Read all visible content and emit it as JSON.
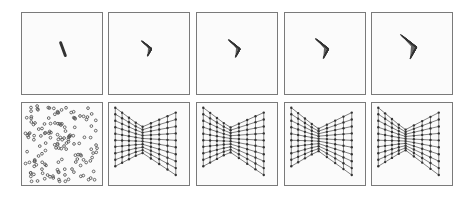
{
  "figure": {
    "background": "#ffffff",
    "panel_border": "#7a7a7a",
    "ink": "#333333",
    "rows": [
      {
        "name": "collapsed-grid-row",
        "panels": [
          {
            "x": 21,
            "y": 12,
            "w": 82,
            "h": 83,
            "kind": "line",
            "cx": 42,
            "cy": 37,
            "len": 14,
            "angle": 70
          },
          {
            "x": 108,
            "y": 12,
            "w": 82,
            "h": 83,
            "kind": "wedge",
            "cx": 40,
            "cy": 36,
            "spread": 0.18,
            "size": 14
          },
          {
            "x": 196,
            "y": 12,
            "w": 82,
            "h": 83,
            "kind": "wedge",
            "cx": 40,
            "cy": 36,
            "spread": 0.22,
            "size": 16
          },
          {
            "x": 284,
            "y": 12,
            "w": 82,
            "h": 83,
            "kind": "wedge",
            "cx": 40,
            "cy": 36,
            "spread": 0.26,
            "size": 18
          },
          {
            "x": 371,
            "y": 12,
            "w": 82,
            "h": 83,
            "kind": "wedge",
            "cx": 40,
            "cy": 34,
            "spread": 0.32,
            "size": 22
          }
        ]
      },
      {
        "name": "expanded-grid-row",
        "panels": [
          {
            "x": 21,
            "y": 102,
            "w": 82,
            "h": 84,
            "kind": "scatter",
            "count": 150,
            "seed": 7
          },
          {
            "x": 108,
            "y": 102,
            "w": 82,
            "h": 84,
            "kind": "bowtie",
            "pinch": 0.42,
            "seed": 1
          },
          {
            "x": 196,
            "y": 102,
            "w": 82,
            "h": 84,
            "kind": "bowtie",
            "pinch": 0.4,
            "seed": 2
          },
          {
            "x": 284,
            "y": 102,
            "w": 82,
            "h": 84,
            "kind": "bowtie",
            "pinch": 0.36,
            "seed": 3
          },
          {
            "x": 371,
            "y": 102,
            "w": 82,
            "h": 84,
            "kind": "bowtie",
            "pinch": 0.33,
            "seed": 4
          }
        ]
      }
    ]
  }
}
